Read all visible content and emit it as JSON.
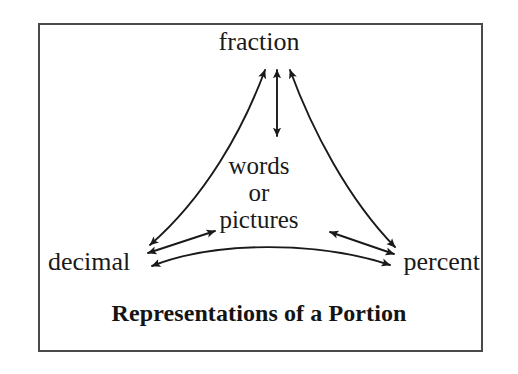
{
  "figure": {
    "title": "Representations of a Portion",
    "border_color": "#4a4a4a",
    "background_color": "#ffffff",
    "ink_color": "#1a1a1a"
  },
  "nodes": {
    "top": "fraction",
    "left": "decimal",
    "right": "percent",
    "center_lines": [
      "words",
      "or",
      "pictures"
    ]
  },
  "connections": [
    {
      "name": "fraction-to-center",
      "from": "fraction",
      "to": "words or pictures",
      "style": "straight",
      "arrowheads": "double"
    },
    {
      "name": "fraction-to-decimal",
      "from": "fraction",
      "to": "decimal",
      "style": "curved",
      "arrowheads": "double"
    },
    {
      "name": "fraction-to-percent",
      "from": "fraction",
      "to": "percent",
      "style": "curved",
      "arrowheads": "double"
    },
    {
      "name": "decimal-to-center",
      "from": "decimal",
      "to": "words or pictures",
      "style": "straight",
      "arrowheads": "double"
    },
    {
      "name": "percent-to-center",
      "from": "percent",
      "to": "words or pictures",
      "style": "straight",
      "arrowheads": "double"
    },
    {
      "name": "decimal-to-percent",
      "from": "decimal",
      "to": "percent",
      "style": "curved",
      "arrowheads": "double"
    }
  ]
}
